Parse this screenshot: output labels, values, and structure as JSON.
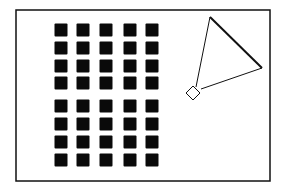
{
  "figure": {
    "frame": {
      "x": 16,
      "y": 10,
      "width": 254,
      "height": 171,
      "stroke": "#111111"
    },
    "square_size": 13,
    "square_fill": "#0a0a0a",
    "columns_x": [
      61,
      83,
      106,
      130,
      152
    ],
    "rows_y": [
      30,
      48,
      66,
      83,
      106,
      124,
      142,
      160
    ],
    "triangle": {
      "apex": [
        210,
        17
      ],
      "right": [
        262,
        68
      ],
      "base_left": [
        196,
        87
      ],
      "base_right": [
        201,
        89
      ]
    },
    "diamond": {
      "center": [
        193,
        93
      ],
      "half": 7
    }
  }
}
